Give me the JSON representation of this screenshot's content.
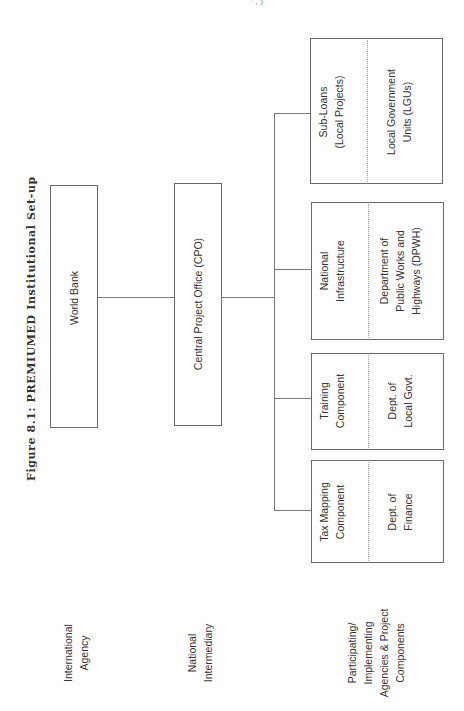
{
  "figure": {
    "title": "Figure 8.1: PREMIUMED Institutional Set-up",
    "header_fragment": "· , )"
  },
  "levels": [
    {
      "label_line1": "International",
      "label_line2": "Agency"
    },
    {
      "label_line1": "National",
      "label_line2": "Intermediary"
    },
    {
      "label_line1": "Participating/",
      "label_line2": "Implementing",
      "label_line3": "Agencies & Project",
      "label_line4": "Components"
    }
  ],
  "nodes": {
    "world_bank": {
      "label": "World Bank"
    },
    "cpo": {
      "label": "Central Project Office (CPO)"
    },
    "components": [
      {
        "component_line1": "Tax Mapping",
        "component_line2": "Component",
        "agency_line1": "Dept. of",
        "agency_line2": "Finance"
      },
      {
        "component_line1": "Training",
        "component_line2": "Component",
        "agency_line1": "Dept. of",
        "agency_line2": "Local Govt."
      },
      {
        "component_line1": "National",
        "component_line2": "Infrastructure",
        "agency_line1": "Department of",
        "agency_line2": "Public Works and",
        "agency_line3": "Highways (DPWH)"
      },
      {
        "component_line1": "Sub-Loans",
        "component_line2": "(Local Projects)",
        "agency_line1": "Local Government",
        "agency_line2": "Units (LGUs)"
      }
    ]
  }
}
